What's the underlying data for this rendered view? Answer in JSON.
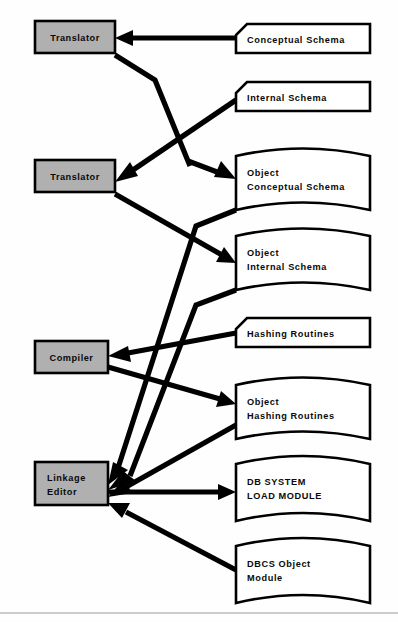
{
  "diagram": {
    "colors": {
      "process_fill": "#b0b0b0",
      "data_fill": "#ffffff",
      "stroke": "#000000",
      "background": "#ffffff",
      "rule": "#9a9a9a"
    },
    "processes": [
      {
        "id": "translator-top",
        "label": "Translator",
        "x": 35,
        "y": 21,
        "w": 80,
        "h": 32
      },
      {
        "id": "translator-mid",
        "label": "Translator",
        "x": 35,
        "y": 160,
        "w": 80,
        "h": 32
      },
      {
        "id": "compiler",
        "label": "Compiler",
        "x": 35,
        "y": 341,
        "w": 73,
        "h": 32
      },
      {
        "id": "linkage-editor",
        "label_line1": "Linkage",
        "label_line2": "Editor",
        "x": 35,
        "y": 462,
        "w": 73,
        "h": 43
      }
    ],
    "cards": [
      {
        "id": "conceptual-schema",
        "label": "Conceptual  Schema",
        "x": 236,
        "y": 24,
        "w": 134,
        "h": 29
      },
      {
        "id": "internal-schema",
        "label": "Internal  Schema",
        "x": 236,
        "y": 82,
        "w": 134,
        "h": 29
      },
      {
        "id": "hashing-routines",
        "label": "Hashing  Routines",
        "x": 236,
        "y": 318,
        "w": 134,
        "h": 29
      }
    ],
    "tapes": [
      {
        "id": "object-conceptual-schema",
        "label_line1": "Object",
        "label_line2": "Conceptual  Schema",
        "x": 236,
        "y": 148,
        "w": 134,
        "h": 62
      },
      {
        "id": "object-internal-schema",
        "label_line1": "Object",
        "label_line2": "Internal  Schema",
        "x": 236,
        "y": 228,
        "w": 134,
        "h": 62
      },
      {
        "id": "object-hashing-routines",
        "label_line1": "Object",
        "label_line2": "Hashing  Routines",
        "x": 236,
        "y": 377,
        "w": 134,
        "h": 62
      },
      {
        "id": "db-system-load-module",
        "label_line1": "DB  SYSTEM",
        "label_line2": "LOAD  MODULE",
        "x": 236,
        "y": 455,
        "w": 134,
        "h": 66
      },
      {
        "id": "dbcs-object-module",
        "label_line1": "DBCS  Object",
        "label_line2": "Module",
        "x": 236,
        "y": 537,
        "w": 134,
        "h": 66
      }
    ],
    "flows": [
      {
        "id": "conceptual-schema-to-translator-top",
        "from": "conceptual-schema",
        "to": "translator-top"
      },
      {
        "id": "translator-top-to-object-conceptual-schema",
        "from": "translator-top",
        "to": "object-conceptual-schema"
      },
      {
        "id": "internal-schema-to-translator-mid",
        "from": "internal-schema",
        "to": "translator-mid"
      },
      {
        "id": "translator-mid-to-object-internal-schema",
        "from": "translator-mid",
        "to": "object-internal-schema"
      },
      {
        "id": "hashing-routines-to-compiler",
        "from": "hashing-routines",
        "to": "compiler"
      },
      {
        "id": "compiler-to-object-hashing-routines",
        "from": "compiler",
        "to": "object-hashing-routines"
      },
      {
        "id": "object-conceptual-schema-to-linkage-editor",
        "from": "object-conceptual-schema",
        "to": "linkage-editor"
      },
      {
        "id": "object-internal-schema-to-linkage-editor",
        "from": "object-internal-schema",
        "to": "linkage-editor"
      },
      {
        "id": "object-hashing-routines-to-linkage-editor",
        "from": "object-hashing-routines",
        "to": "linkage-editor"
      },
      {
        "id": "linkage-editor-to-db-system-load-module",
        "from": "linkage-editor",
        "to": "db-system-load-module"
      },
      {
        "id": "dbcs-object-module-to-linkage-editor",
        "from": "dbcs-object-module",
        "to": "linkage-editor"
      }
    ]
  }
}
